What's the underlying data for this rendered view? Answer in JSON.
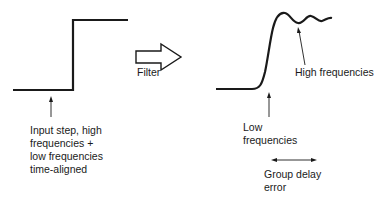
{
  "diagram": {
    "arrow_label": "Filter",
    "input": {
      "caption_lines": [
        "Input step, high",
        "frequencies +",
        "low frequencies",
        "time-aligned"
      ]
    },
    "output": {
      "high_label": "High frequencies",
      "low_label_lines": [
        "Low",
        "frequencies"
      ],
      "delay_label_lines": [
        "Group delay",
        "error"
      ]
    },
    "colors": {
      "ink": "#1a1a1a",
      "background": "#ffffff"
    }
  }
}
